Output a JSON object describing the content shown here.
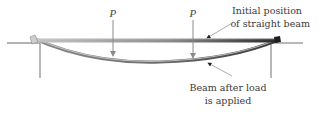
{
  "diagram": {
    "type": "simply-supported beam deflection",
    "loads": [
      {
        "label": "P",
        "x": 113
      },
      {
        "label": "P",
        "x": 193
      }
    ],
    "annotations": {
      "initial": {
        "line1": "Initial position",
        "line2": "of straight beam"
      },
      "deflected": {
        "line1": "Beam after load",
        "line2": "is applied"
      }
    },
    "colors": {
      "beam_light": "#b8b8b8",
      "beam_dark": "#2e2e2e",
      "support": "#9a9a9a",
      "arrow": "#8a8a8a",
      "text": "#3a3a3a"
    }
  }
}
